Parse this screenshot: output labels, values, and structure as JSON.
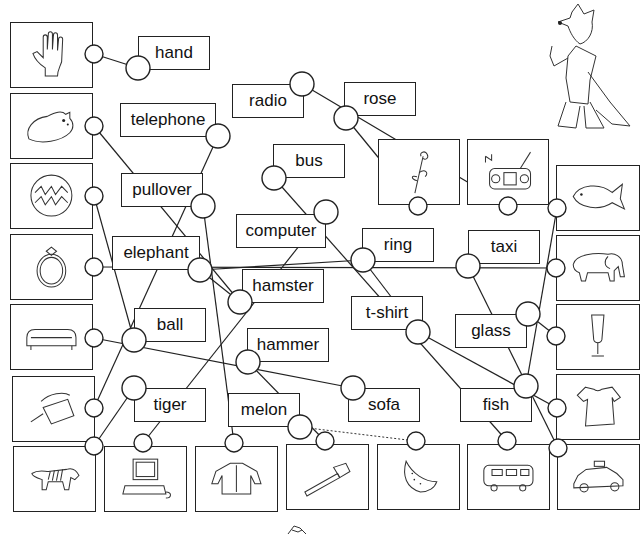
{
  "worksheet": {
    "words": [
      {
        "id": "hand",
        "label": "hand"
      },
      {
        "id": "radio",
        "label": "radio"
      },
      {
        "id": "rose",
        "label": "rose"
      },
      {
        "id": "telephone",
        "label": "telephone"
      },
      {
        "id": "bus",
        "label": "bus"
      },
      {
        "id": "pullover",
        "label": "pullover"
      },
      {
        "id": "computer",
        "label": "computer"
      },
      {
        "id": "ring",
        "label": "ring"
      },
      {
        "id": "taxi",
        "label": "taxi"
      },
      {
        "id": "elephant",
        "label": "elephant"
      },
      {
        "id": "hamster",
        "label": "hamster"
      },
      {
        "id": "t-shirt",
        "label": "t-shirt"
      },
      {
        "id": "glass",
        "label": "glass"
      },
      {
        "id": "ball",
        "label": "ball"
      },
      {
        "id": "hammer",
        "label": "hammer"
      },
      {
        "id": "tiger",
        "label": "tiger"
      },
      {
        "id": "melon",
        "label": "melon"
      },
      {
        "id": "sofa",
        "label": "sofa"
      },
      {
        "id": "fish",
        "label": "fish"
      }
    ],
    "pictures": [
      {
        "id": "hand",
        "icon": "hand-picture"
      },
      {
        "id": "hamster",
        "icon": "hamster-picture"
      },
      {
        "id": "ball",
        "icon": "ball-picture"
      },
      {
        "id": "ring",
        "icon": "ring-picture"
      },
      {
        "id": "sofa",
        "icon": "sofa-picture"
      },
      {
        "id": "telephone",
        "icon": "telephone-picture"
      },
      {
        "id": "tiger",
        "icon": "tiger-picture"
      },
      {
        "id": "computer",
        "icon": "computer-picture"
      },
      {
        "id": "pullover",
        "icon": "pullover-picture"
      },
      {
        "id": "hammer",
        "icon": "hammer-picture"
      },
      {
        "id": "melon",
        "icon": "melon-picture"
      },
      {
        "id": "bus",
        "icon": "bus-picture"
      },
      {
        "id": "taxi",
        "icon": "taxi-picture"
      },
      {
        "id": "rose",
        "icon": "rose-picture"
      },
      {
        "id": "radio",
        "icon": "radio-picture"
      },
      {
        "id": "fish",
        "icon": "fish-picture"
      },
      {
        "id": "elephant",
        "icon": "elephant-picture"
      },
      {
        "id": "glass",
        "icon": "glass-picture"
      },
      {
        "id": "t-shirt",
        "icon": "tshirt-picture"
      }
    ],
    "mascot": "fox-teacher-illustration"
  }
}
